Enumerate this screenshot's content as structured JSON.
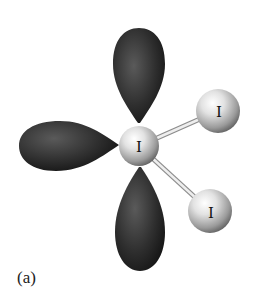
{
  "figure": {
    "caption": "(a)",
    "central_atom": {
      "label": "I",
      "cx": 139,
      "cy": 146,
      "r": 20
    },
    "bonded_atoms": [
      {
        "label": "I",
        "cx": 218,
        "cy": 111,
        "r": 22
      },
      {
        "label": "I",
        "cx": 210,
        "cy": 211,
        "r": 22
      }
    ],
    "lone_pair_lobes": [
      {
        "name": "top",
        "direction": "up"
      },
      {
        "name": "left",
        "direction": "left"
      },
      {
        "name": "bottom",
        "direction": "down"
      }
    ],
    "colors": {
      "lobe_dark": "#1e1e1e",
      "lobe_mid": "#4a4a4a",
      "sphere_light": "#f4f4f4",
      "sphere_dark": "#6b6b6b",
      "bond": "#d8d8d8",
      "background": "#ffffff"
    }
  }
}
